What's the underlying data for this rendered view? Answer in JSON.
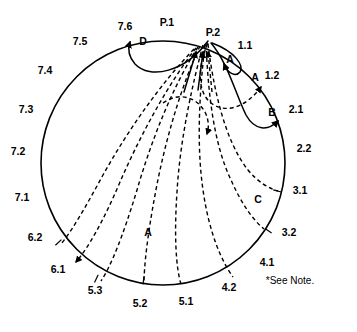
{
  "diagram": {
    "note": "*See Note.",
    "circle": {
      "center_x": 163,
      "center_y": 163,
      "radius": 122,
      "stroke_color": "#000000"
    },
    "boundary_labels": [
      {
        "id": "p1",
        "text": "P.1",
        "x": 167,
        "y": 26
      },
      {
        "id": "p2",
        "text": "P.2",
        "x": 213,
        "y": 36
      },
      {
        "id": "n1_1",
        "text": "1.1",
        "x": 245,
        "y": 49
      },
      {
        "id": "n1_2",
        "text": "1.2",
        "x": 272,
        "y": 79
      },
      {
        "id": "n2_1",
        "text": "2.1",
        "x": 296,
        "y": 113
      },
      {
        "id": "n2_2",
        "text": "2.2",
        "x": 304,
        "y": 152
      },
      {
        "id": "n3_1",
        "text": "3.1",
        "x": 300,
        "y": 194
      },
      {
        "id": "n3_2",
        "text": "3.2",
        "x": 289,
        "y": 236
      },
      {
        "id": "n4_1",
        "text": "4.1",
        "x": 267,
        "y": 266
      },
      {
        "id": "n4_2",
        "text": "4.2",
        "x": 229,
        "y": 291
      },
      {
        "id": "n5_1",
        "text": "5.1",
        "x": 186,
        "y": 305
      },
      {
        "id": "n5_2",
        "text": "5.2",
        "x": 140,
        "y": 307
      },
      {
        "id": "n5_3",
        "text": "5.3",
        "x": 95,
        "y": 294
      },
      {
        "id": "n6_1",
        "text": "6.1",
        "x": 58,
        "y": 273
      },
      {
        "id": "n6_2",
        "text": "6.2",
        "x": 35,
        "y": 241
      },
      {
        "id": "n7_1",
        "text": "7.1",
        "x": 22,
        "y": 201
      },
      {
        "id": "n7_2",
        "text": "7.2",
        "x": 18,
        "y": 155
      },
      {
        "id": "n7_3",
        "text": "7.3",
        "x": 26,
        "y": 113
      },
      {
        "id": "n7_4",
        "text": "7.4",
        "x": 45,
        "y": 74
      },
      {
        "id": "n7_5",
        "text": "7.5",
        "x": 80,
        "y": 45
      },
      {
        "id": "n7_6",
        "text": "7.6",
        "x": 125,
        "y": 30
      }
    ],
    "curve_labels": [
      {
        "id": "label-a-top",
        "text": "A",
        "x": 230,
        "y": 63
      },
      {
        "id": "label-a-right",
        "text": "A",
        "x": 255,
        "y": 81
      },
      {
        "id": "label-b",
        "text": "B",
        "x": 272,
        "y": 116
      },
      {
        "id": "label-c",
        "text": "C",
        "x": 258,
        "y": 203
      },
      {
        "id": "label-d",
        "text": "D",
        "x": 143,
        "y": 45
      },
      {
        "id": "label-a-bottom",
        "text": "A",
        "x": 148,
        "y": 236
      }
    ],
    "origin_node": "P.2",
    "solid_curves": [
      {
        "id": "curve-d",
        "label": "D",
        "from": "P.2",
        "to": "7.6"
      },
      {
        "id": "curve-a1",
        "label": "A",
        "from": "P.2",
        "to": "1.1"
      },
      {
        "id": "curve-b",
        "label": "B",
        "from": "P.2",
        "to": "2.1"
      }
    ],
    "dashed_curves": [
      {
        "id": "dash-a2",
        "label": "A",
        "from": "P.2",
        "to": "1.2"
      },
      {
        "id": "dash-c",
        "label": "C",
        "from": "P.2",
        "to": "3.1"
      },
      {
        "id": "dash-3-2",
        "label": "",
        "from": "P.2",
        "to": "3.2"
      },
      {
        "id": "dash-4-2",
        "label": "",
        "from": "P.2",
        "to": "4.2"
      },
      {
        "id": "dash-5-1",
        "label": "",
        "from": "P.2",
        "to": "5.1"
      },
      {
        "id": "dash-5-2",
        "label": "",
        "from": "P.2",
        "to": "5.2"
      },
      {
        "id": "dash-5-3",
        "label": "A",
        "from": "P.2",
        "to": "5.3"
      },
      {
        "id": "dash-6-1",
        "label": "",
        "from": "P.2",
        "to": "6.1"
      },
      {
        "id": "dash-6-2",
        "label": "",
        "from": "P.2",
        "to": "6.2"
      }
    ]
  }
}
